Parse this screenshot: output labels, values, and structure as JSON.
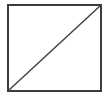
{
  "figure": {
    "name": "square-with-diagonal",
    "caption": "",
    "canvas": {
      "width": 109,
      "height": 98,
      "background_color": "#ffffff"
    },
    "shapes": {
      "square": {
        "label": "square-outline",
        "x": 8,
        "y": 5,
        "width": 93,
        "height": 86,
        "stroke_color": "#3c3c3c",
        "stroke_width": 1.6,
        "fill_color": "#ffffff"
      },
      "diagonal": {
        "label": "diagonal-line",
        "x1": 8,
        "y1": 91,
        "x2": 101,
        "y2": 5,
        "stroke_color": "#434343",
        "stroke_width": 1.5,
        "direction": "bottom-left-to-top-right"
      }
    }
  }
}
